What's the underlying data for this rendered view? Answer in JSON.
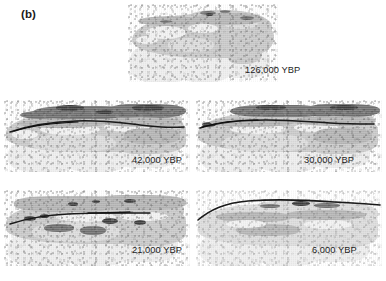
{
  "figure": {
    "panel_letter": "(b)",
    "background_color": "#ffffff",
    "caption_text_color": "#1d1d1d",
    "units_label": "YBP"
  },
  "palette": {
    "dark_belt": "#6f6f6f",
    "darkest_patch": "#3c3c3c",
    "mid_belt": "#b4b4b4",
    "land_base": "#c9c9c9",
    "pale_belt": "#dcdcdc",
    "light_belt": "#f2f2f2",
    "ghost_land": "#eeeeee",
    "route_line": "#1a1a1a"
  },
  "maps": [
    {
      "id": "map-126000",
      "label": "126,000 YBP",
      "time_value": 126000,
      "region": "Eurasia",
      "row": 1,
      "column": "center",
      "has_route_line": false,
      "dark_belt_extent": "moderate",
      "label_x": 245,
      "label_y": 66
    },
    {
      "id": "map-42000",
      "label": "42,000 YBP",
      "time_value": 42000,
      "region": "Eurasia",
      "row": 2,
      "column": "left",
      "has_route_line": true,
      "dark_belt_extent": "extensive",
      "label_x": 132,
      "label_y": 156
    },
    {
      "id": "map-30000",
      "label": "30,000 YBP",
      "time_value": 30000,
      "region": "Eurasia",
      "row": 2,
      "column": "right",
      "has_route_line": true,
      "dark_belt_extent": "extensive",
      "label_x": 304,
      "label_y": 156
    },
    {
      "id": "map-21000",
      "label": "21,000 YBP",
      "time_value": 21000,
      "region": "Eurasia",
      "row": 3,
      "column": "left",
      "has_route_line": true,
      "dark_belt_extent": "patchy",
      "label_x": 132,
      "label_y": 246
    },
    {
      "id": "map-6000",
      "label": "6,000 YBP",
      "time_value": 6000,
      "region": "Eurasia",
      "row": 3,
      "column": "right",
      "has_route_line": true,
      "dark_belt_extent": "minimal",
      "label_x": 312,
      "label_y": 246
    }
  ]
}
